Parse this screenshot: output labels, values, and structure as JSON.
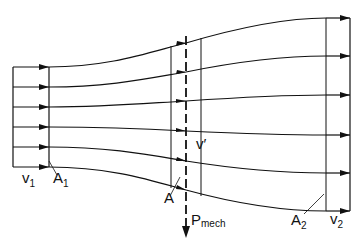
{
  "colors": {
    "line": "#111111",
    "background": "#ffffff"
  },
  "labels": {
    "v1": {
      "base": "v",
      "sub": "1"
    },
    "A1": {
      "base": "A",
      "sub": "1"
    },
    "A": {
      "base": "A"
    },
    "v_prime": {
      "base": "v′"
    },
    "P_mech": {
      "base": "P",
      "sub": "mech"
    },
    "A2": {
      "base": "A",
      "sub": "2"
    },
    "v2": {
      "base": "v",
      "sub": "2"
    }
  },
  "streamlines": [
    {
      "name": "streamline-1",
      "y_in": 67,
      "y_mid": 43,
      "y_out": 18
    },
    {
      "name": "streamline-2",
      "y_in": 87,
      "y_mid": 72,
      "y_out": 56
    },
    {
      "name": "streamline-3",
      "y_in": 107,
      "y_mid": 101,
      "y_out": 95
    },
    {
      "name": "streamline-4",
      "y_in": 127,
      "y_mid": 131,
      "y_out": 135
    },
    {
      "name": "streamline-5",
      "y_in": 147,
      "y_mid": 161,
      "y_out": 173
    },
    {
      "name": "streamline-6",
      "y_in": 167,
      "y_mid": 190,
      "y_out": 211
    }
  ]
}
